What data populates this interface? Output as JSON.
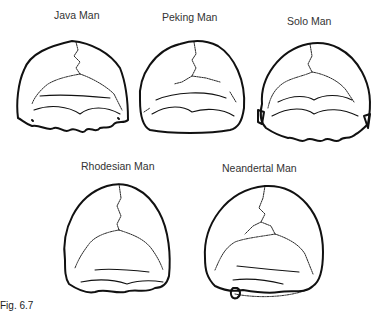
{
  "figure": {
    "skulls": [
      {
        "label": "Java Man"
      },
      {
        "label": "Peking Man"
      },
      {
        "label": "Solo Man"
      },
      {
        "label": "Rhodesian Man"
      },
      {
        "label": "Neandertal Man"
      }
    ],
    "caption": "Fig. 6.7"
  }
}
